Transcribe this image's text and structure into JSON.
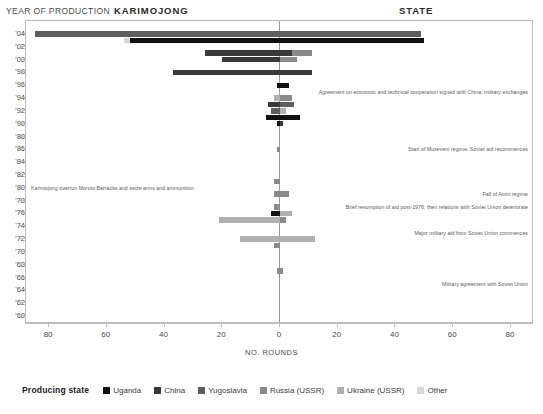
{
  "header": {
    "year_axis_title": "YEAR OF PRODUCTION",
    "left_title": "KARIMOJONG",
    "right_title": "STATE"
  },
  "axes": {
    "x_label": "NO. ROUNDS",
    "x_ticks": [
      "80",
      "60",
      "40",
      "20",
      "0",
      "20",
      "40",
      "60",
      "80"
    ],
    "y_ticks": [
      "'04",
      "'02",
      "'00",
      "'98",
      "'96",
      "'94",
      "'92",
      "'90",
      "'88",
      "'86",
      "'84",
      "'82",
      "'80",
      "'78",
      "'76",
      "'74",
      "'72",
      "'70",
      "'68",
      "'66",
      "'64",
      "'62",
      "'60"
    ]
  },
  "legend": {
    "title": "Producing state",
    "items": [
      {
        "label": "Uganda",
        "color": "#111111"
      },
      {
        "label": "China",
        "color": "#3a3a3a"
      },
      {
        "label": "Yugoslavia",
        "color": "#5e5e5e"
      },
      {
        "label": "Russia (USSR)",
        "color": "#8a8a8a"
      },
      {
        "label": "Ukraine (USSR)",
        "color": "#b0b0b0"
      },
      {
        "label": "Other",
        "color": "#d8d8d8"
      }
    ]
  },
  "annotations": [
    {
      "text": "Agreement on economic and technical cooperation signed with China; military exchanges",
      "year": "'95",
      "side": "right"
    },
    {
      "text": "Start of Museveni regime. Soviet aid recommences",
      "year": "'86",
      "side": "right"
    },
    {
      "text": "Karimojong overrun Moroto Barracks and seize arms and ammunition",
      "year": "'80",
      "side": "left"
    },
    {
      "text": "Fall of Amin regime",
      "year": "'79",
      "side": "right"
    },
    {
      "text": "Brief resumption of aid post-1976, then relations with Soviet Union deteriorate",
      "year": "'77",
      "side": "right"
    },
    {
      "text": "Major military aid from Soviet Union commences",
      "year": "'73",
      "side": "right"
    },
    {
      "text": "Military agreement with Soviet Union",
      "year": "'65",
      "side": "right"
    }
  ],
  "chart_data": {
    "type": "bar",
    "orientation": "horizontal-diverging",
    "xlabel": "NO. ROUNDS",
    "ylabel": "YEAR OF PRODUCTION",
    "xlim": [
      -88,
      88
    ],
    "left_panel": "KARIMOJONG",
    "right_panel": "STATE",
    "grid": false,
    "legend_position": "bottom",
    "categories": [
      "'04",
      "'02",
      "'00",
      "'98",
      "'96",
      "'94",
      "'92",
      "'90",
      "'88",
      "'86",
      "'84",
      "'82",
      "'80",
      "'78",
      "'76",
      "'74",
      "'72",
      "'70",
      "'68",
      "'66",
      "'64",
      "'62",
      "'60"
    ],
    "series": [
      {
        "name": "Uganda",
        "color": "#111111"
      },
      {
        "name": "China",
        "color": "#3a3a3a"
      },
      {
        "name": "Yugoslavia",
        "color": "#5e5e5e"
      },
      {
        "name": "Russia (USSR)",
        "color": "#8a8a8a"
      },
      {
        "name": "Ukraine (USSR)",
        "color": "#b0b0b0"
      },
      {
        "name": "Other",
        "color": "#d8d8d8"
      }
    ],
    "bars": [
      {
        "year": "'04",
        "side": "karimojong",
        "from": 0,
        "to": 85,
        "producer": "Yugoslavia"
      },
      {
        "year": "'04",
        "side": "state",
        "from": 0,
        "to": 49,
        "producer": "Yugoslavia"
      },
      {
        "year": "'03",
        "side": "karimojong",
        "from": 52,
        "to": 54,
        "producer": "Other"
      },
      {
        "year": "'03",
        "side": "karimojong",
        "from": 0,
        "to": 52,
        "producer": "Uganda"
      },
      {
        "year": "'03",
        "side": "state",
        "from": 0,
        "to": 50,
        "producer": "Uganda"
      },
      {
        "year": "'01",
        "side": "karimojong",
        "from": 0,
        "to": 26,
        "producer": "China"
      },
      {
        "year": "'01",
        "side": "state",
        "from": 0,
        "to": 11,
        "producer": "China"
      },
      {
        "year": "'01",
        "side": "state",
        "from": 4,
        "to": 11,
        "producer": "Russia (USSR)"
      },
      {
        "year": "'00",
        "side": "karimojong",
        "from": 0,
        "to": 20,
        "producer": "China"
      },
      {
        "year": "'00",
        "side": "state",
        "from": 0,
        "to": 6,
        "producer": "Russia (USSR)"
      },
      {
        "year": "'98",
        "side": "karimojong",
        "from": 0,
        "to": 37,
        "producer": "China"
      },
      {
        "year": "'98",
        "side": "state",
        "from": 0,
        "to": 11,
        "producer": "China"
      },
      {
        "year": "'96",
        "side": "state",
        "from": 0,
        "to": 3,
        "producer": "Uganda"
      },
      {
        "year": "'96",
        "side": "karimojong",
        "from": 0,
        "to": 1,
        "producer": "Uganda"
      },
      {
        "year": "'94",
        "side": "karimojong",
        "from": 0,
        "to": 2,
        "producer": "Ukraine (USSR)"
      },
      {
        "year": "'94",
        "side": "state",
        "from": 0,
        "to": 4,
        "producer": "Russia (USSR)"
      },
      {
        "year": "'93",
        "side": "karimojong",
        "from": 0,
        "to": 4,
        "producer": "China"
      },
      {
        "year": "'93",
        "side": "state",
        "from": 0,
        "to": 5,
        "producer": "Yugoslavia"
      },
      {
        "year": "'92",
        "side": "karimojong",
        "from": 0,
        "to": 3,
        "producer": "Yugoslavia"
      },
      {
        "year": "'92",
        "side": "state",
        "from": 0,
        "to": 2,
        "producer": "Ukraine (USSR)"
      },
      {
        "year": "'91",
        "side": "karimojong",
        "from": 0,
        "to": 5,
        "producer": "Uganda"
      },
      {
        "year": "'91",
        "side": "state",
        "from": 0,
        "to": 7,
        "producer": "Uganda"
      },
      {
        "year": "'90",
        "side": "karimojong",
        "from": 0,
        "to": 1,
        "producer": "Uganda"
      },
      {
        "year": "'90",
        "side": "state",
        "from": 0,
        "to": 1,
        "producer": "China"
      },
      {
        "year": "'86",
        "side": "karimojong",
        "from": 0,
        "to": 1,
        "producer": "Russia (USSR)"
      },
      {
        "year": "'81",
        "side": "karimojong",
        "from": 0,
        "to": 2,
        "producer": "Russia (USSR)"
      },
      {
        "year": "'79",
        "side": "karimojong",
        "from": 0,
        "to": 2,
        "producer": "Russia (USSR)"
      },
      {
        "year": "'79",
        "side": "state",
        "from": 0,
        "to": 3,
        "producer": "Russia (USSR)"
      },
      {
        "year": "'77",
        "side": "karimojong",
        "from": 0,
        "to": 2,
        "producer": "Russia (USSR)"
      },
      {
        "year": "'76",
        "side": "karimojong",
        "from": 0,
        "to": 3,
        "producer": "Uganda"
      },
      {
        "year": "'76",
        "side": "state",
        "from": 0,
        "to": 4,
        "producer": "Ukraine (USSR)"
      },
      {
        "year": "'75",
        "side": "karimojong",
        "from": 0,
        "to": 21,
        "producer": "Ukraine (USSR)"
      },
      {
        "year": "'75",
        "side": "state",
        "from": 0,
        "to": 2,
        "producer": "Russia (USSR)"
      },
      {
        "year": "'72",
        "side": "karimojong",
        "from": 0,
        "to": 14,
        "producer": "Ukraine (USSR)"
      },
      {
        "year": "'72",
        "side": "state",
        "from": 0,
        "to": 12,
        "producer": "Ukraine (USSR)"
      },
      {
        "year": "'71",
        "side": "karimojong",
        "from": 0,
        "to": 2,
        "producer": "Russia (USSR)"
      },
      {
        "year": "'67",
        "side": "karimojong",
        "from": 0,
        "to": 1,
        "producer": "Russia (USSR)"
      },
      {
        "year": "'67",
        "side": "state",
        "from": 0,
        "to": 1,
        "producer": "Russia (USSR)"
      }
    ]
  }
}
